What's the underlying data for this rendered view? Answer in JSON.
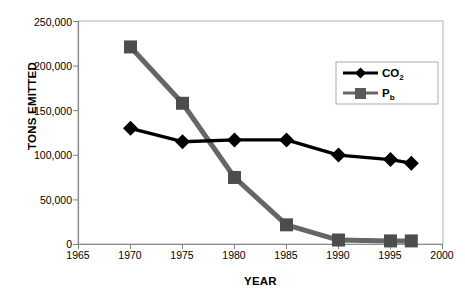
{
  "figure": {
    "cropped_title_fragment": "",
    "background_color": "#ffffff"
  },
  "axes": {
    "y_title": "TONS EMITTED",
    "x_title": "YEAR",
    "y_tick_labels": [
      "250,000",
      "200,000",
      "150,000",
      "100,000",
      "50,000",
      "0"
    ],
    "x_tick_labels": [
      "1965",
      "1970",
      "1975",
      "1980",
      "1985",
      "1990",
      "1995",
      "2000"
    ]
  },
  "legend": {
    "entries": [
      {
        "label": "CO",
        "subscript": "2",
        "color": "#000000",
        "marker": "diamond"
      },
      {
        "label": "P",
        "subscript": "b",
        "color": "#666666",
        "marker": "square"
      }
    ]
  },
  "chart_data": {
    "type": "line",
    "title": "",
    "xlabel": "YEAR",
    "ylabel": "TONS EMITTED",
    "xlim": [
      1965,
      2000
    ],
    "ylim": [
      0,
      250000
    ],
    "ytick_step": 50000,
    "xtick_step": 5,
    "grid": false,
    "legend_position": "upper-right-inside",
    "x": [
      1970,
      1975,
      1980,
      1985,
      1990,
      1995,
      1997
    ],
    "series": [
      {
        "name": "CO2",
        "color": "#000000",
        "marker": "diamond",
        "values": [
          130000,
          115000,
          117000,
          117000,
          100000,
          95000,
          91000
        ]
      },
      {
        "name": "Pb",
        "color": "#666666",
        "marker": "square",
        "values": [
          221000,
          158000,
          75000,
          22000,
          5000,
          4000,
          4000
        ]
      }
    ]
  }
}
